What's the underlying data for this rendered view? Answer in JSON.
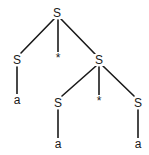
{
  "diagram": {
    "type": "parse-tree",
    "nodes": [
      {
        "id": "n0",
        "label": "S",
        "x": 57,
        "y": 13
      },
      {
        "id": "n1",
        "label": "S",
        "x": 17,
        "y": 60
      },
      {
        "id": "n2",
        "label": "*",
        "x": 58,
        "y": 58
      },
      {
        "id": "n3",
        "label": "S",
        "x": 99,
        "y": 60
      },
      {
        "id": "n4",
        "label": "a",
        "x": 17,
        "y": 100
      },
      {
        "id": "n5",
        "label": "S",
        "x": 58,
        "y": 103
      },
      {
        "id": "n6",
        "label": "*",
        "x": 99,
        "y": 101
      },
      {
        "id": "n7",
        "label": "S",
        "x": 138,
        "y": 103
      },
      {
        "id": "n8",
        "label": "a",
        "x": 58,
        "y": 144
      },
      {
        "id": "n9",
        "label": "a",
        "x": 138,
        "y": 144
      }
    ],
    "edges": [
      {
        "from": "n0",
        "to": "n1",
        "x1": 54,
        "y1": 19,
        "x2": 21,
        "y2": 53
      },
      {
        "from": "n0",
        "to": "n2",
        "x1": 58,
        "y1": 20,
        "x2": 58,
        "y2": 53
      },
      {
        "from": "n0",
        "to": "n3",
        "x1": 61,
        "y1": 19,
        "x2": 95,
        "y2": 54
      },
      {
        "from": "n1",
        "to": "n4",
        "x1": 17,
        "y1": 67,
        "x2": 17,
        "y2": 94
      },
      {
        "from": "n3",
        "to": "n5",
        "x1": 96,
        "y1": 66,
        "x2": 62,
        "y2": 96
      },
      {
        "from": "n3",
        "to": "n6",
        "x1": 99,
        "y1": 67,
        "x2": 99,
        "y2": 96
      },
      {
        "from": "n3",
        "to": "n7",
        "x1": 103,
        "y1": 66,
        "x2": 134,
        "y2": 96
      },
      {
        "from": "n5",
        "to": "n8",
        "x1": 58,
        "y1": 110,
        "x2": 58,
        "y2": 138
      },
      {
        "from": "n7",
        "to": "n9",
        "x1": 138,
        "y1": 110,
        "x2": 138,
        "y2": 138
      }
    ]
  }
}
